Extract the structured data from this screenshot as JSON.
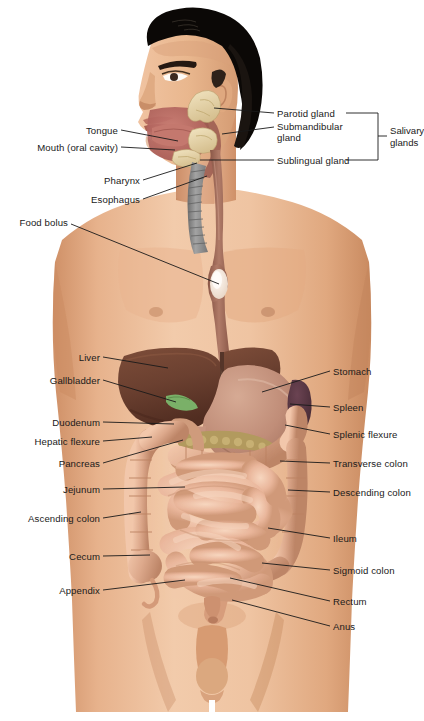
{
  "figure": {
    "background_color": "#ffffff",
    "label_color": "#1a1a1a",
    "leader_color": "#1a1a1a"
  },
  "palette": {
    "skin_light": "#f0c6a4",
    "skin_mid": "#e3ab83",
    "skin_shadow": "#c98f68",
    "hair": "#0b0806",
    "liver": "#6b4030",
    "liver_light": "#7d4d3a",
    "stomach": "#c08d78",
    "stomach_light": "#cfa08b",
    "gallbladder": "#7ab068",
    "spleen": "#55343f",
    "pancreas": "#b29a5e",
    "intestine": "#eab79c",
    "intestine_light": "#f4cdb4",
    "colon": "#dda98c",
    "esophagus": "#a9705f",
    "trachea": "#8d8d8d",
    "oral_cavity": "#b9645f",
    "salivary": "#e7d6a8",
    "bolus": "#f5ece2"
  },
  "labels_left": [
    {
      "id": "tongue",
      "text": "Tongue",
      "x": 118,
      "y": 130,
      "tip_x": 178,
      "tip_y": 141
    },
    {
      "id": "mouth",
      "text": "Mouth (oral cavity)",
      "x": 118,
      "y": 147,
      "tip_x": 175,
      "tip_y": 150
    },
    {
      "id": "pharynx",
      "text": "Pharynx",
      "x": 140,
      "y": 180,
      "tip_x": 197,
      "tip_y": 163
    },
    {
      "id": "esophagus",
      "text": "Esophagus",
      "x": 140,
      "y": 199,
      "tip_x": 207,
      "tip_y": 176
    },
    {
      "id": "food-bolus",
      "text": "Food bolus",
      "x": 68,
      "y": 222,
      "tip_x": 219,
      "tip_y": 284
    },
    {
      "id": "liver",
      "text": "Liver",
      "x": 100,
      "y": 357,
      "tip_x": 168,
      "tip_y": 368
    },
    {
      "id": "gallbladder",
      "text": "Gallbladder",
      "x": 100,
      "y": 380,
      "tip_x": 176,
      "tip_y": 402
    },
    {
      "id": "duodenum",
      "text": "Duodenum",
      "x": 100,
      "y": 422,
      "tip_x": 174,
      "tip_y": 424
    },
    {
      "id": "hepatic-flexure",
      "text": "Hepatic flexure",
      "x": 100,
      "y": 441,
      "tip_x": 152,
      "tip_y": 437
    },
    {
      "id": "pancreas",
      "text": "Pancreas",
      "x": 100,
      "y": 463,
      "tip_x": 183,
      "tip_y": 440
    },
    {
      "id": "jejunum",
      "text": "Jejunum",
      "x": 100,
      "y": 489,
      "tip_x": 185,
      "tip_y": 487
    },
    {
      "id": "ascending-colon",
      "text": "Ascending colon",
      "x": 100,
      "y": 518,
      "tip_x": 141,
      "tip_y": 512
    },
    {
      "id": "cecum",
      "text": "Cecum",
      "x": 100,
      "y": 556,
      "tip_x": 150,
      "tip_y": 555
    },
    {
      "id": "appendix",
      "text": "Appendix",
      "x": 100,
      "y": 590,
      "tip_x": 185,
      "tip_y": 580
    }
  ],
  "labels_right": [
    {
      "id": "stomach",
      "text": "Stomach",
      "x": 333,
      "y": 371,
      "tip_x": 262,
      "tip_y": 392
    },
    {
      "id": "spleen",
      "text": "Spleen",
      "x": 333,
      "y": 407,
      "tip_x": 290,
      "tip_y": 404
    },
    {
      "id": "splenic-flexure",
      "text": "Splenic flexure",
      "x": 333,
      "y": 434,
      "tip_x": 285,
      "tip_y": 425
    },
    {
      "id": "transverse-colon",
      "text": "Transverse colon",
      "x": 333,
      "y": 463,
      "tip_x": 280,
      "tip_y": 461
    },
    {
      "id": "descending-colon",
      "text": "Descending colon",
      "x": 333,
      "y": 492,
      "tip_x": 288,
      "tip_y": 490
    },
    {
      "id": "ileum",
      "text": "Ileum",
      "x": 333,
      "y": 538,
      "tip_x": 268,
      "tip_y": 528
    },
    {
      "id": "sigmoid-colon",
      "text": "Sigmoid colon",
      "x": 333,
      "y": 570,
      "tip_x": 262,
      "tip_y": 563
    },
    {
      "id": "rectum",
      "text": "Rectum",
      "x": 333,
      "y": 601,
      "tip_x": 230,
      "tip_y": 578
    },
    {
      "id": "anus",
      "text": "Anus",
      "x": 333,
      "y": 626,
      "tip_x": 232,
      "tip_y": 600
    }
  ],
  "salivary_group": {
    "items": [
      {
        "id": "parotid-gland",
        "text": "Parotid gland",
        "x": 277,
        "y": 113,
        "tip_x": 214,
        "tip_y": 108,
        "two_line": false
      },
      {
        "id": "submandibular-gland",
        "text": "Submandibular",
        "text2": "gland",
        "x": 277,
        "y": 127,
        "tip_x": 222,
        "tip_y": 134,
        "two_line": true
      },
      {
        "id": "sublingual-gland",
        "text": "Sublingual gland",
        "x": 277,
        "y": 160,
        "tip_x": 200,
        "tip_y": 160,
        "two_line": false
      }
    ],
    "bracket": {
      "x": 378,
      "y_top": 112,
      "y_bottom": 161,
      "tick_y": 136
    },
    "group_label": {
      "text": "Salivary",
      "text2": "glands",
      "x": 390,
      "y": 136
    }
  }
}
